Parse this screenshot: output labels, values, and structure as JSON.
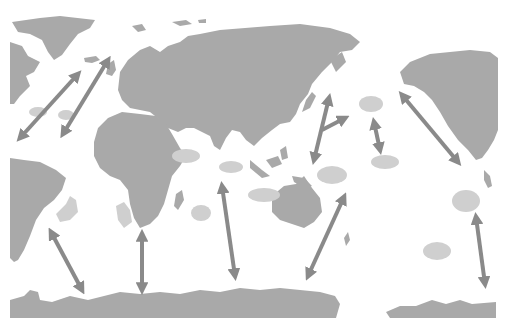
{
  "header": {
    "clipped_text": "",
    "note": "header text cut off at the top edge; not legible"
  },
  "map": {
    "type": "world map",
    "projection": "Pacific-centred, east Pacific to the right",
    "colors": {
      "background": "#ffffff",
      "land": "#a9a9a9",
      "zone": "#cfcfcf",
      "arrow": "#8a8a8a"
    },
    "zones": [
      {
        "id": "caribbean-west",
        "x": 38,
        "y": 112
      },
      {
        "id": "caribbean-east",
        "x": 66,
        "y": 115
      },
      {
        "id": "south-atlantic-brazil",
        "x": 68,
        "y": 208
      },
      {
        "id": "southeast-atlantic",
        "x": 124,
        "y": 213
      },
      {
        "id": "arabian-sea",
        "x": 186,
        "y": 156
      },
      {
        "id": "madagascar-east",
        "x": 201,
        "y": 213
      },
      {
        "id": "north-indian",
        "x": 231,
        "y": 167
      },
      {
        "id": "timor-sea",
        "x": 270,
        "y": 193
      },
      {
        "id": "coral-sea",
        "x": 332,
        "y": 175
      },
      {
        "id": "north-pacific-1",
        "x": 372,
        "y": 104
      },
      {
        "id": "north-pacific-2",
        "x": 385,
        "y": 160
      },
      {
        "id": "south-pacific-east",
        "x": 468,
        "y": 202
      },
      {
        "id": "south-pacific-central",
        "x": 437,
        "y": 251
      }
    ],
    "routes": [
      {
        "id": "north-atlantic-west",
        "from": [
          18,
          140
        ],
        "to": [
          80,
          72
        ]
      },
      {
        "id": "north-atlantic-east",
        "from": [
          62,
          137
        ],
        "to": [
          110,
          58
        ]
      },
      {
        "id": "south-atlantic-west",
        "from": [
          50,
          230
        ],
        "to": [
          83,
          293
        ]
      },
      {
        "id": "south-atlantic-east",
        "from": [
          142,
          231
        ],
        "to": [
          142,
          292
        ]
      },
      {
        "id": "indian-ocean",
        "from": [
          222,
          183
        ],
        "to": [
          236,
          278
        ]
      },
      {
        "id": "southwest-pacific",
        "from": [
          308,
          278
        ],
        "to": [
          345,
          195
        ]
      },
      {
        "id": "west-pacific-north",
        "from": [
          313,
          163
        ],
        "to": [
          330,
          96
        ]
      },
      {
        "id": "west-pacific-branch",
        "from": [
          322,
          131
        ],
        "to": [
          346,
          117
        ]
      },
      {
        "id": "central-north-pacific",
        "from": [
          374,
          120
        ],
        "to": [
          381,
          151
        ]
      },
      {
        "id": "northeast-pacific",
        "from": [
          400,
          93
        ],
        "to": [
          460,
          164
        ]
      },
      {
        "id": "southeast-pacific",
        "from": [
          476,
          215
        ],
        "to": [
          486,
          286
        ]
      }
    ]
  }
}
